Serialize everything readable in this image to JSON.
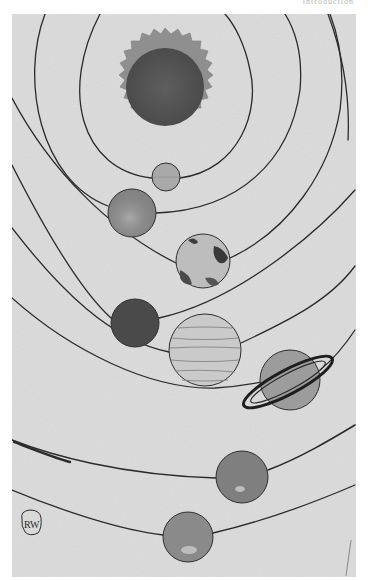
{
  "page": {
    "running_head": "Introduction"
  },
  "illustration": {
    "subject": "Hand-painted solar system",
    "background_color": "#dcdcdc",
    "orbit_color": "#2b2b2b",
    "sun": {
      "label": "Sun",
      "cx": 165,
      "cy": 87,
      "core_r": 39,
      "corona_r": 58,
      "core_color": "#555555",
      "corona_color": "#8c8c8c"
    },
    "planets": [
      {
        "name": "Mercury",
        "cx": 166,
        "cy": 177,
        "r": 14,
        "color": "#a9a9a9"
      },
      {
        "name": "Venus",
        "cx": 132,
        "cy": 213,
        "r": 24,
        "color": "#8e8e8e"
      },
      {
        "name": "Earth",
        "cx": 203,
        "cy": 261,
        "r": 27,
        "color": "#b4b4b4"
      },
      {
        "name": "Mars",
        "cx": 135,
        "cy": 323,
        "r": 24,
        "color": "#4a4a4a"
      },
      {
        "name": "Jupiter",
        "cx": 205,
        "cy": 350,
        "r": 36,
        "color": "#c8c8c8"
      },
      {
        "name": "Saturn",
        "cx": 290,
        "cy": 380,
        "r": 30,
        "color": "#9a9a9a"
      },
      {
        "name": "Uranus",
        "cx": 242,
        "cy": 477,
        "r": 26,
        "color": "#808080"
      },
      {
        "name": "Neptune",
        "cx": 188,
        "cy": 537,
        "r": 25,
        "color": "#8a8a8a"
      }
    ],
    "signature": "RW"
  }
}
